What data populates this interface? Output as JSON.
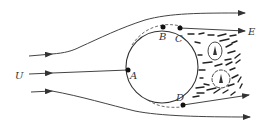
{
  "diagram": {
    "free_stream_label": "U",
    "points": [
      {
        "id": "A",
        "label": "A"
      },
      {
        "id": "B",
        "label": "B"
      },
      {
        "id": "C",
        "label": "C"
      },
      {
        "id": "D",
        "label": "D"
      },
      {
        "id": "E",
        "label": "E"
      }
    ],
    "colors": {
      "stroke": "#333333",
      "background": "#ffffff"
    }
  }
}
